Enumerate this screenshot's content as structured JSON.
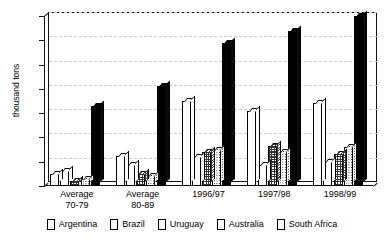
{
  "chart_data": {
    "type": "bar",
    "title": "",
    "xlabel": "",
    "ylabel": "thousand tons",
    "ylim": [
      0,
      700
    ],
    "yticks": [
      0,
      100,
      200,
      300,
      400,
      500,
      600,
      700
    ],
    "grid": true,
    "legend_position": "bottom",
    "categories": [
      "Average\n70-79",
      "Average\n80-89",
      "1996/97",
      "1997/98",
      "1998/99"
    ],
    "series": [
      {
        "name": "Argentina",
        "pattern": "vertical-stripes",
        "values": [
          48,
          125,
          350,
          310,
          340
        ]
      },
      {
        "name": "Brazil",
        "pattern": "solid-white",
        "values": [
          62,
          88,
          120,
          85,
          100
        ]
      },
      {
        "name": "Uruguay",
        "pattern": "crosshatch",
        "values": [
          22,
          50,
          140,
          165,
          130
        ]
      },
      {
        "name": "Australia",
        "pattern": "dotted",
        "values": [
          28,
          40,
          150,
          140,
          160
        ]
      },
      {
        "name": "South Africa",
        "pattern": "solid-black",
        "values": [
          330,
          410,
          590,
          640,
          700
        ]
      }
    ]
  },
  "axis": {
    "y_title": "thousand tons",
    "y_tick_labels": [
      "700",
      "600",
      "500",
      "400",
      "300",
      "200",
      "100",
      "0"
    ],
    "x_tick_labels": [
      "Average\n70-79",
      "Average\n80-89",
      "1996/97",
      "1997/98",
      "1998/99"
    ]
  },
  "legend": {
    "items": [
      {
        "label": "Argentina"
      },
      {
        "label": "Brazil"
      },
      {
        "label": "Uruguay"
      },
      {
        "label": "Australia"
      },
      {
        "label": "South Africa"
      }
    ]
  },
  "colors": {
    "axis": "#111111",
    "gridline": "#c9c9c9",
    "background": "#ffffff",
    "series_dark": "#000000"
  }
}
